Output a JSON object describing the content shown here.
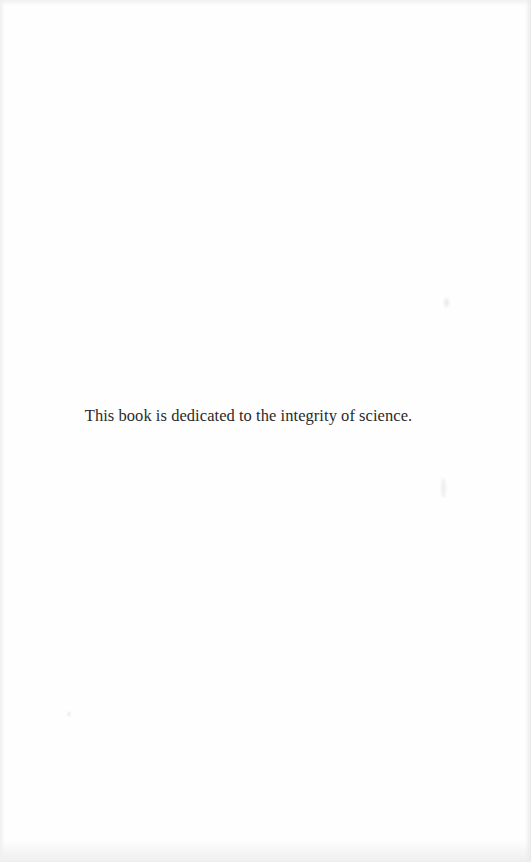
{
  "page": {
    "dedication_text": "This book is dedicated to the integrity of science."
  },
  "colors": {
    "paper": "#fefefe",
    "ink": "#2a2a2a"
  }
}
